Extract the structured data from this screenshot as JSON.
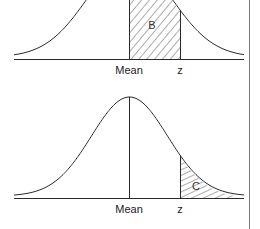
{
  "diagram": {
    "type": "normal-distribution-areas",
    "colors": {
      "stroke": "#2a2a2a",
      "hatch": "#444444",
      "divider": "#777777",
      "background": "#ffffff"
    },
    "panels": [
      {
        "id": "top",
        "shaded_region": "B",
        "shaded_description": "area between mean and z",
        "axis_labels": {
          "mean": "Mean",
          "z": "z"
        }
      },
      {
        "id": "bottom",
        "shaded_region": "C",
        "shaded_description": "area beyond z (right tail)",
        "axis_labels": {
          "mean": "Mean",
          "z": "z"
        }
      }
    ]
  }
}
